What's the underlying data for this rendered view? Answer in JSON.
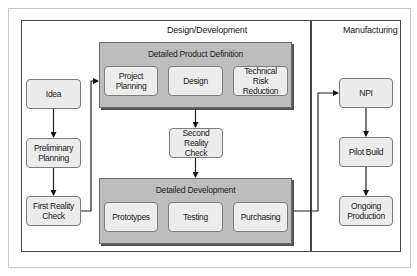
{
  "diagram": {
    "sections": {
      "design": {
        "label": "Design/Development"
      },
      "manufacturing": {
        "label": "Manufacturing"
      }
    },
    "left_column": [
      {
        "id": "idea",
        "label": "Idea"
      },
      {
        "id": "preliminary-planning",
        "label": "Preliminary Planning"
      },
      {
        "id": "first-reality-check",
        "label": "First Reality Check"
      }
    ],
    "groups": {
      "product_definition": {
        "title": "Detailed Product Definition",
        "items": [
          {
            "id": "project-planning",
            "label": "Project Planning"
          },
          {
            "id": "design",
            "label": "Design"
          },
          {
            "id": "technical-risk-reduction",
            "label": "Technical Risk Reduction"
          }
        ]
      },
      "second_check": {
        "label": "Second Reality Check"
      },
      "development": {
        "title": "Detailed Development",
        "items": [
          {
            "id": "prototypes",
            "label": "Prototypes"
          },
          {
            "id": "testing",
            "label": "Testing"
          },
          {
            "id": "purchasing",
            "label": "Purchasing"
          }
        ]
      }
    },
    "right_column": [
      {
        "id": "npi",
        "label": "NPI"
      },
      {
        "id": "pilot-build",
        "label": "Pilot Build"
      },
      {
        "id": "ongoing-production",
        "label": "Ongoing Production"
      }
    ],
    "edges": [
      {
        "from": "Idea",
        "to": "Preliminary Planning"
      },
      {
        "from": "Preliminary Planning",
        "to": "First Reality Check"
      },
      {
        "from": "First Reality Check",
        "to": "Detailed Product Definition"
      },
      {
        "from": "Detailed Product Definition",
        "to": "Second Reality Check"
      },
      {
        "from": "Second Reality Check",
        "to": "Detailed Development"
      },
      {
        "from": "Detailed Development",
        "to": "NPI"
      },
      {
        "from": "NPI",
        "to": "Pilot Build"
      },
      {
        "from": "Pilot Build",
        "to": "Ongoing Production"
      }
    ],
    "colors": {
      "group_fill": "#bdbdbd",
      "node_fill": "#ececec",
      "frame_line": "#444444"
    }
  }
}
